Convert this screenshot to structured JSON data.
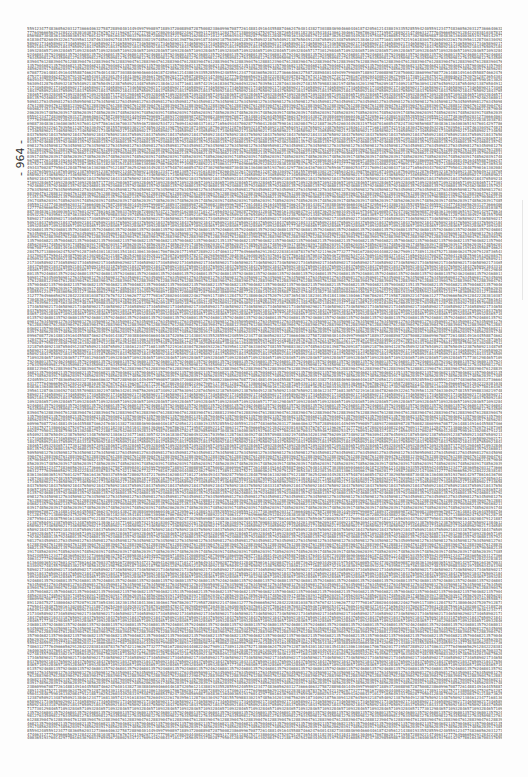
{
  "page": {
    "page_number_label": "- 964 -",
    "background_color": "#fdfdfd",
    "text_color": "#555555"
  },
  "digit_block": {
    "description": "Dense block of decimal digits (illegible at screenshot resolution; representative lines)",
    "line_count": 195,
    "lines_sample": [
      "5591234774836056203127366640632758728898401449499799089718893720088987287500823860996708772614881491644558874662476401438273038846904660446187420561214380193355285594240",
      "7406312777649666562912842228381038783767674211962677327779816728020444082246279091173891128475271380046247520791287365430118230135418413061304661706786201771958728892214",
      "6085478247302985698873048361364003651937601429778616436700337659467280025347217609416208437101271656493437002877950412848759016130208479121887362542603449283197548701",
      "4612347716813057421916183047826049322617039561128746330492748155709883302197485634201398756209187340921875630941287645093218765409213876504912387650921348765092138",
      "9021734658902173465890217346589021734658902173465890217346589021734658902173465890217346589021734658902173465890217346589021734658902173465890217346589021734658902",
      "3187650921843765092184376509218437650921843765092184376509218437650921843765092184376509218437650921843765092184376509218437650921843765092184376509218437650921843",
      "7730129846571093284657109328465710932846571093284657109328465710932846571093284657109328465710932846571093284657109328465710932846571093284657109328465710932846571",
      "2468013579246801357924680135792468013579246801357924680135792468013579246801357924680135792468013579246801357924680135792468013579246801357924680135792468013579246",
      "5098127634509812763450981276345098127634509812763450981276345098127634509812763450981276345098127634509812763450981276345098127634509812763450981276345098127634509",
      "8812390476128839047612883904761288390476128839047612883904761288390476128839047612883904761288390476128839047612883904761288390476128839047612883904761288390476128",
      "1357904682135790468213579046821357904682135790468213579046821357904682135790468213579046821357904682135790468213579046821357904682135790468213579046821357904682135",
      "6203917485620391748562039174856203917485620391748562039174856203917485620391748562039174856203917485620391748562039174856203917485620391748562039174856203917485620"
    ]
  }
}
